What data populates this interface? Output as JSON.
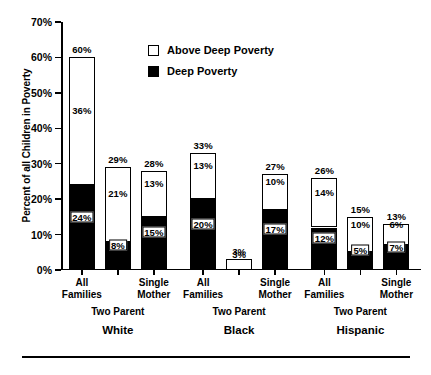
{
  "chart_data": {
    "type": "bar",
    "title": "",
    "xlabel": "",
    "ylabel": "Percent of all Children in Poverty",
    "ylim": [
      0,
      70
    ],
    "ytick_labels": [
      "0%",
      "10%",
      "20%",
      "30%",
      "40%",
      "50%",
      "60%",
      "70%"
    ],
    "ytick_values": [
      0,
      10,
      20,
      30,
      40,
      50,
      60,
      70
    ],
    "grid": false,
    "stacked": true,
    "legend_position": "top-center",
    "legend": [
      {
        "label": "Above Deep Poverty",
        "swatch": "white"
      },
      {
        "label": "Deep Poverty",
        "swatch": "black"
      }
    ],
    "categories": [
      "All Families",
      "Two Parent",
      "Single Mother",
      "All Families",
      "Two Parent",
      "Single Mother",
      "All Families",
      "Two Parent",
      "Single Mother"
    ],
    "groups": [
      "White",
      "Black",
      "Hispanic"
    ],
    "series": [
      {
        "name": "Deep Poverty",
        "color": "#000000",
        "values": [
          24,
          8,
          15,
          20,
          0,
          17,
          12,
          5,
          7
        ]
      },
      {
        "name": "Above Deep Poverty",
        "color": "#ffffff",
        "values": [
          36,
          21,
          13,
          13,
          3,
          10,
          14,
          10,
          6
        ]
      }
    ],
    "totals": [
      60,
      29,
      28,
      33,
      3,
      27,
      26,
      15,
      13
    ],
    "bars": [
      {
        "group": "White",
        "category": "All Families",
        "total": "60%",
        "above": "36%",
        "deep": "24%",
        "total_v": 60,
        "above_v": 36,
        "deep_v": 24
      },
      {
        "group": "White",
        "category": "Two Parent",
        "total": "29%",
        "above": "21%",
        "deep": "8%",
        "total_v": 29,
        "above_v": 21,
        "deep_v": 8
      },
      {
        "group": "White",
        "category": "Single Mother",
        "total": "28%",
        "above": "13%",
        "deep": "15%",
        "total_v": 28,
        "above_v": 13,
        "deep_v": 15
      },
      {
        "group": "Black",
        "category": "All Families",
        "total": "33%",
        "above": "13%",
        "deep": "20%",
        "total_v": 33,
        "above_v": 13,
        "deep_v": 20
      },
      {
        "group": "Black",
        "category": "Two Parent",
        "total": "3%",
        "above": "3%",
        "deep": "",
        "total_v": 3,
        "above_v": 3,
        "deep_v": 0
      },
      {
        "group": "Black",
        "category": "Single Mother",
        "total": "27%",
        "above": "10%",
        "deep": "17%",
        "total_v": 27,
        "above_v": 10,
        "deep_v": 17
      },
      {
        "group": "Hispanic",
        "category": "All Families",
        "total": "26%",
        "above": "14%",
        "deep": "12%",
        "total_v": 26,
        "above_v": 14,
        "deep_v": 12
      },
      {
        "group": "Hispanic",
        "category": "Two Parent",
        "total": "15%",
        "above": "10%",
        "deep": "5%",
        "total_v": 15,
        "above_v": 10,
        "deep_v": 5
      },
      {
        "group": "Hispanic",
        "category": "Single Mother",
        "total": "13%",
        "above": "6%",
        "deep": "7%",
        "total_v": 13,
        "above_v": 6,
        "deep_v": 7
      }
    ]
  },
  "axis": {
    "y_label": "Percent of all Children in Poverty",
    "ticks": [
      "70%",
      "60%",
      "50%",
      "40%",
      "30%",
      "20%",
      "10%",
      "0%"
    ]
  },
  "legend": {
    "above_label": "Above Deep Poverty",
    "deep_label": "Deep Poverty"
  },
  "xaxis": {
    "cat_all": "All\nFamilies",
    "cat_two": "Two Parent",
    "cat_single": "Single\nMother",
    "group_white": "White",
    "group_black": "Black",
    "group_hispanic": "Hispanic"
  }
}
